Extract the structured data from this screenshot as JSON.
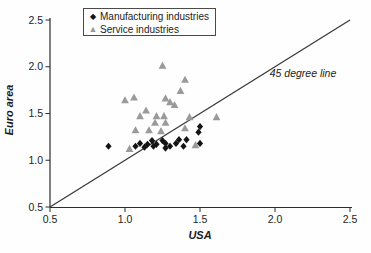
{
  "chart_data": {
    "type": "scatter",
    "title": "",
    "xlabel": "USA",
    "ylabel": "Euro area",
    "xlim": [
      0.5,
      2.5
    ],
    "ylim": [
      0.5,
      2.5
    ],
    "xticks": [
      "0.5",
      "1.0",
      "1.5",
      "2.0",
      "2.5"
    ],
    "yticks": [
      "0.5",
      "1.0",
      "1.5",
      "2.0",
      "2.5"
    ],
    "grid": false,
    "legend_position": "top-left-inside",
    "reference_line": {
      "label": "45 degree line",
      "from": [
        0.5,
        0.5
      ],
      "to": [
        2.5,
        2.5
      ],
      "color": "#3a3a3a"
    },
    "series": [
      {
        "name": "Manufacturing industries",
        "marker": "diamond",
        "color": "#141414",
        "points": [
          [
            0.89,
            1.15
          ],
          [
            1.07,
            1.15
          ],
          [
            1.1,
            1.18
          ],
          [
            1.13,
            1.14
          ],
          [
            1.15,
            1.17
          ],
          [
            1.18,
            1.21
          ],
          [
            1.19,
            1.15
          ],
          [
            1.21,
            1.17
          ],
          [
            1.25,
            1.21
          ],
          [
            1.27,
            1.18
          ],
          [
            1.27,
            1.13
          ],
          [
            1.3,
            1.15
          ],
          [
            1.34,
            1.18
          ],
          [
            1.36,
            1.22
          ],
          [
            1.39,
            1.15
          ],
          [
            1.41,
            1.22
          ],
          [
            1.49,
            1.3
          ],
          [
            1.5,
            1.36
          ],
          [
            1.5,
            1.18
          ]
        ]
      },
      {
        "name": "Service industries",
        "marker": "triangle",
        "color": "#9a9a9a",
        "points": [
          [
            1.25,
            2.01
          ],
          [
            1.4,
            1.86
          ],
          [
            1.37,
            1.74
          ],
          [
            1.0,
            1.64
          ],
          [
            1.06,
            1.67
          ],
          [
            1.27,
            1.66
          ],
          [
            1.3,
            1.62
          ],
          [
            1.33,
            1.59
          ],
          [
            1.14,
            1.53
          ],
          [
            1.1,
            1.47
          ],
          [
            1.21,
            1.47
          ],
          [
            1.26,
            1.47
          ],
          [
            1.43,
            1.46
          ],
          [
            1.61,
            1.46
          ],
          [
            1.2,
            1.4
          ],
          [
            1.27,
            1.4
          ],
          [
            1.07,
            1.32
          ],
          [
            1.16,
            1.32
          ],
          [
            1.24,
            1.31
          ],
          [
            1.4,
            1.34
          ],
          [
            1.03,
            1.12
          ],
          [
            1.47,
            1.16
          ]
        ]
      }
    ],
    "axis_color": "#2b2b2b",
    "tick_label_color": "#1c1c1c"
  }
}
